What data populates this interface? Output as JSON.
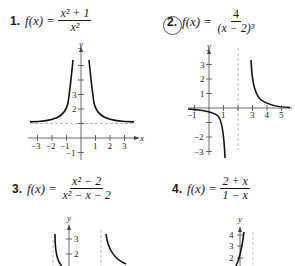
{
  "problems": [
    {
      "number": "1.",
      "lhs": "f(x)",
      "eq": "=",
      "numerator": "x² + 1",
      "denominator": "x²",
      "circled": false
    },
    {
      "number": "2.",
      "lhs": "f(x)",
      "eq": "=",
      "numerator": "4",
      "denominator": "(x − 2)³",
      "circled": true
    },
    {
      "number": "3.",
      "lhs": "f(x)",
      "eq": "=",
      "numerator": "x² − 2",
      "denominator": "x² − x − 2",
      "circled": false
    },
    {
      "number": "4.",
      "lhs": "f(x)",
      "eq": "=",
      "numerator": "2 + x",
      "denominator": "1 − x",
      "circled": false
    }
  ],
  "graphs": [
    {
      "id": 1,
      "x_label": "x",
      "y_label": "y",
      "x_ticks": [
        "−3",
        "−2",
        "−1",
        "1",
        "2",
        "3"
      ],
      "y_ticks": [
        "2",
        "3",
        "−1"
      ],
      "asymptotes": {
        "vertical": "x = 0",
        "horizontal": "y = 1"
      }
    },
    {
      "id": 2,
      "x_label": "x",
      "y_label": "y",
      "x_ticks": [
        "−1",
        "1",
        "3",
        "4",
        "5"
      ],
      "y_ticks": [
        "3",
        "2",
        "1",
        "−2",
        "−3"
      ],
      "asymptotes": {
        "vertical": "x = 2",
        "horizontal": "y = 0"
      }
    },
    {
      "id": 3,
      "y_label": "y",
      "y_ticks": [
        "3",
        "2"
      ]
    },
    {
      "id": 4,
      "y_label": "y",
      "y_ticks": [
        "4",
        "3",
        "2"
      ]
    }
  ]
}
